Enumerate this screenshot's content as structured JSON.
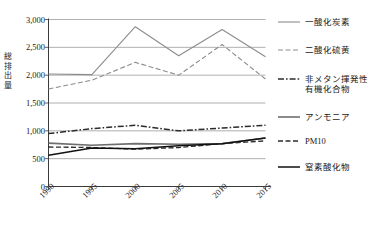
{
  "axes": {
    "ylabel": "総排出量",
    "yticks": [
      "3,000",
      "2,500",
      "2,000",
      "1,500",
      "1,000",
      "500",
      "0"
    ],
    "xticks": [
      "1990",
      "1995",
      "2000",
      "2005",
      "2010",
      "2015"
    ]
  },
  "legend": {
    "items": [
      {
        "label": "一酸化炭素",
        "style": "solid",
        "color": "#8c8c8c",
        "width": 1.1
      },
      {
        "label": "二酸化硫黄",
        "style": "dashed",
        "color": "#8c8c8c",
        "width": 1.1
      },
      {
        "label": "非メタン揮発性\n有機化合物",
        "style": "dashdot",
        "color": "#2b2b2b",
        "width": 1.5
      },
      {
        "label": "アンモニア",
        "style": "solid",
        "color": "#6e6e6e",
        "width": 1.6
      },
      {
        "label": "PM10",
        "style": "dashed",
        "color": "#2b2b2b",
        "width": 1.3
      },
      {
        "label": "窒素酸化物",
        "style": "solid",
        "color": "#111111",
        "width": 1.5
      }
    ]
  },
  "chart_data": {
    "type": "line",
    "title": "",
    "xlabel": "",
    "ylabel": "総排出量",
    "x": [
      1990,
      1995,
      2000,
      2005,
      2010,
      2015
    ],
    "ylim": [
      0,
      3000
    ],
    "ytick_values": [
      0,
      500,
      1000,
      1500,
      2000,
      2500,
      3000
    ],
    "grid": true,
    "legend_position": "right",
    "series": [
      {
        "name": "一酸化炭素",
        "values": [
          2020,
          2010,
          2870,
          2350,
          2820,
          2330
        ]
      },
      {
        "name": "二酸化硫黄",
        "values": [
          1750,
          1910,
          2230,
          2000,
          2550,
          1930
        ]
      },
      {
        "name": "非メタン揮発性有機化合物",
        "values": [
          950,
          1040,
          1100,
          1000,
          1050,
          1100
        ]
      },
      {
        "name": "アンモニア",
        "values": [
          780,
          740,
          770,
          760,
          770,
          870
        ]
      },
      {
        "name": "PM10",
        "values": [
          710,
          700,
          670,
          700,
          770,
          820
        ]
      },
      {
        "name": "窒素酸化物",
        "values": [
          560,
          690,
          680,
          730,
          770,
          870
        ]
      }
    ]
  }
}
